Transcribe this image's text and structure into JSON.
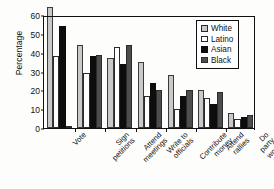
{
  "chart_data": {
    "type": "bar",
    "title": "",
    "xlabel": "",
    "ylabel": "Percentage",
    "ylim": [
      0,
      60
    ],
    "yticks": [
      0,
      10,
      20,
      30,
      40,
      50,
      60
    ],
    "grid": false,
    "legend_position": "top-right",
    "categories": [
      "Vote",
      "Sign petitions",
      "Attend meetings",
      "Write to officials",
      "Contribute money",
      "Attend rallies",
      "Do party work"
    ],
    "series": [
      {
        "name": "White",
        "color": "#c9c9c9",
        "values": [
          64,
          44,
          37,
          35,
          28,
          20,
          8
        ]
      },
      {
        "name": "Latino",
        "color": "#ffffff",
        "values": [
          38.5,
          29,
          43,
          17,
          10,
          16,
          5
        ]
      },
      {
        "name": "Asian",
        "color": "#0d0d0d",
        "values": [
          54,
          38,
          34,
          24,
          17,
          13,
          6
        ]
      },
      {
        "name": "Black",
        "color": "#4d4d4d",
        "values": [
          1,
          39,
          44,
          20,
          20,
          19,
          7
        ]
      }
    ]
  },
  "axis": {
    "y_title": "Percentage",
    "y_tick_labels": [
      "0",
      "10",
      "20",
      "30",
      "40",
      "50",
      "60"
    ],
    "x_tick_labels": [
      "Vote",
      "Sign\npetitions",
      "Attend\nmeetings",
      "Write to\nofficials",
      "Contribute\nmoney",
      "Attend\nrallies",
      "Do party\nwork"
    ]
  },
  "legend": {
    "entries": [
      {
        "label": "White",
        "swatch": "white-s"
      },
      {
        "label": "Latino",
        "swatch": "latino-s"
      },
      {
        "label": "Asian",
        "swatch": "asian-s"
      },
      {
        "label": "Black",
        "swatch": "black-s"
      }
    ]
  }
}
